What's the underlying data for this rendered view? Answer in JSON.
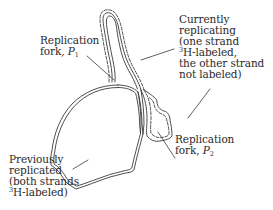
{
  "diagram": {
    "type": "autoradiograph-sketch",
    "colors": {
      "outline": "#3a3a3a",
      "leader": "#3a3a3a",
      "text": "#2a2a2a",
      "background": "#ffffff"
    }
  },
  "labels": {
    "fork_p1": {
      "line1": "Replication",
      "line2_prefix": "fork, ",
      "symbol": "P",
      "subscript": "1"
    },
    "current": {
      "line1": "Currently",
      "line2": "replicating",
      "line3": "(one strand",
      "line4_sup": "3",
      "line4_rest": "H-labeled,",
      "line5": "the other strand",
      "line6": "not labeled)"
    },
    "fork_p2": {
      "line1": "Replication",
      "line2_prefix": "fork, ",
      "symbol": "P",
      "subscript": "2"
    },
    "previous": {
      "line1": "Previously",
      "line2": "replicated",
      "line3": "(both strands",
      "line4_sup": "3",
      "line4_rest": "H-labeled)"
    }
  },
  "legend_semantics": {
    "solid_double_line": "both strands 3H-labeled (previously replicated)",
    "dashed_line_pair": "one strand labeled, one unlabeled (currently replicating)"
  }
}
